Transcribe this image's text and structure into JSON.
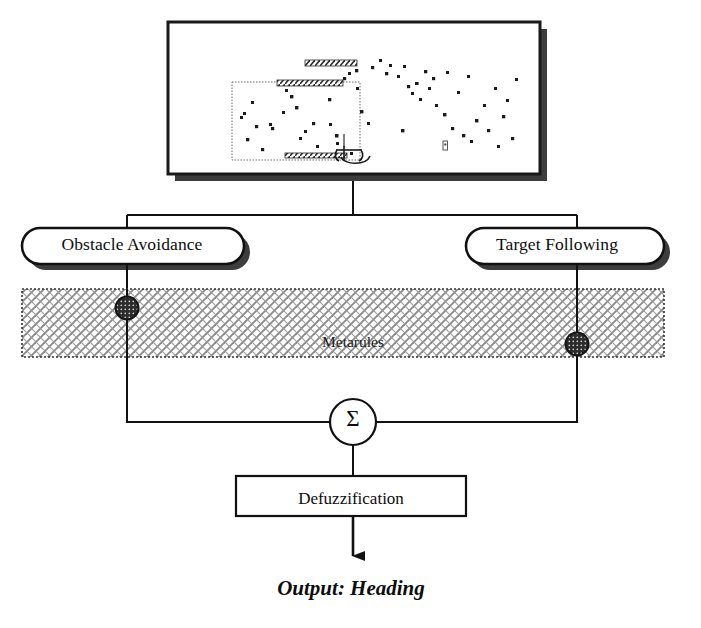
{
  "diagram": {
    "type": "flow-diagram"
  },
  "simulation_panel": {
    "name": "robot-simulation-view",
    "caption": "",
    "frame": {
      "x": 168,
      "y": 22,
      "width": 372,
      "height": 152
    },
    "shadow_offset": 7,
    "border_color": "#1a1a1a",
    "background_color": "#ffffff",
    "inner_region": {
      "x": 232,
      "y": 82,
      "width": 128,
      "height": 78,
      "style": "dotted"
    },
    "walls": [
      {
        "x": 305,
        "y": 60,
        "width": 52,
        "height": 6,
        "label": "wall-upper"
      },
      {
        "x": 277,
        "y": 80,
        "width": 66,
        "height": 6,
        "label": "wall-mid"
      },
      {
        "x": 285,
        "y": 153,
        "width": 62,
        "height": 5,
        "label": "wall-lower"
      }
    ],
    "robot": {
      "x": 355,
      "y": 148,
      "label": "robot"
    },
    "target": {
      "x": 444,
      "y": 144,
      "label": "target-marker"
    },
    "obstacle_dots": [
      [
        272,
        128
      ],
      [
        270,
        124
      ],
      [
        262,
        149
      ],
      [
        283,
        112
      ],
      [
        296,
        107
      ],
      [
        300,
        138
      ],
      [
        305,
        131
      ],
      [
        313,
        123
      ],
      [
        317,
        146
      ],
      [
        329,
        99
      ],
      [
        330,
        124
      ],
      [
        336,
        135
      ],
      [
        337,
        143
      ],
      [
        344,
        78
      ],
      [
        349,
        73
      ],
      [
        351,
        153
      ],
      [
        356,
        70
      ],
      [
        357,
        88
      ],
      [
        361,
        111
      ],
      [
        368,
        123
      ],
      [
        372,
        67
      ],
      [
        380,
        60
      ],
      [
        386,
        73
      ],
      [
        390,
        65
      ],
      [
        398,
        76
      ],
      [
        402,
        130
      ],
      [
        404,
        66
      ],
      [
        408,
        86
      ],
      [
        412,
        93
      ],
      [
        416,
        83
      ],
      [
        420,
        99
      ],
      [
        425,
        71
      ],
      [
        429,
        88
      ],
      [
        433,
        78
      ],
      [
        436,
        105
      ],
      [
        444,
        114
      ],
      [
        447,
        72
      ],
      [
        452,
        128
      ],
      [
        458,
        92
      ],
      [
        463,
        135
      ],
      [
        468,
        76
      ],
      [
        471,
        141
      ],
      [
        476,
        120
      ],
      [
        484,
        105
      ],
      [
        488,
        130
      ],
      [
        495,
        88
      ],
      [
        498,
        146
      ],
      [
        503,
        116
      ],
      [
        507,
        100
      ],
      [
        512,
        138
      ],
      [
        516,
        79
      ],
      [
        241,
        117
      ],
      [
        244,
        113
      ],
      [
        247,
        139
      ],
      [
        252,
        102
      ],
      [
        256,
        126
      ],
      [
        286,
        90
      ],
      [
        291,
        96
      ]
    ]
  },
  "behaviours": [
    {
      "id": "obstacle-avoidance",
      "label": "Obstacle Avoidance",
      "shape": "stadium",
      "x": 22,
      "y": 228,
      "width": 222,
      "height": 36
    },
    {
      "id": "target-following",
      "label": "Target Following",
      "shape": "stadium",
      "x": 466,
      "y": 228,
      "width": 198,
      "height": 36
    }
  ],
  "metarules": {
    "label": "Metarules",
    "band": {
      "x": 22,
      "y": 289,
      "width": 642,
      "height": 68
    },
    "fill_pattern": "crosshatch",
    "border_style": "dotted",
    "nodes": [
      {
        "id": "metarule-node-left",
        "x": 127,
        "y": 308,
        "r": 11
      },
      {
        "id": "metarule-node-right",
        "x": 577,
        "y": 344,
        "r": 11
      }
    ]
  },
  "summation": {
    "symbol": "Σ",
    "label": "Summation",
    "cx": 353,
    "cy": 422,
    "r": 23
  },
  "defuzzification": {
    "label": "Defuzzification",
    "box": {
      "x": 236,
      "y": 476,
      "width": 230,
      "height": 40
    }
  },
  "output": {
    "label": "Output: Heading",
    "arrow_from_y": 516,
    "arrow_to_y": 566
  },
  "colors": {
    "stroke": "#111111",
    "shadow": "#3d3d3d",
    "hatch": "#8a8a8a",
    "node_fill": "#2b2b2b",
    "text": "#0d0d0d",
    "background": "#ffffff"
  },
  "connectors": [
    {
      "id": "panel-to-bus",
      "from": "simulation_panel",
      "to": "split-bus"
    },
    {
      "id": "bus-to-obstacle",
      "from": "split-bus",
      "to": "obstacle-avoidance"
    },
    {
      "id": "bus-to-target",
      "from": "split-bus",
      "to": "target-following"
    },
    {
      "id": "obstacle-to-sum",
      "from": "obstacle-avoidance",
      "to": "summation"
    },
    {
      "id": "target-to-sum",
      "from": "target-following",
      "to": "summation"
    },
    {
      "id": "sum-to-defuzz",
      "from": "summation",
      "to": "defuzzification"
    },
    {
      "id": "defuzz-to-output",
      "from": "defuzzification",
      "to": "output"
    }
  ]
}
